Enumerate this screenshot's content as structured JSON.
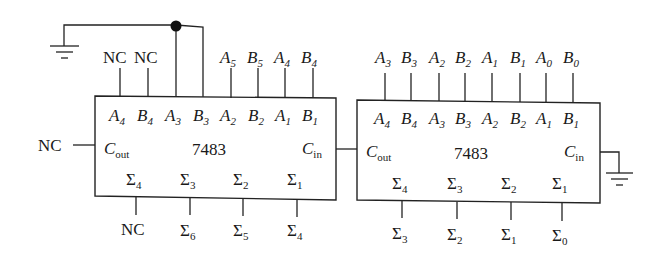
{
  "diagram": {
    "chips": [
      {
        "id": "left",
        "part": "7483",
        "inputs_inside": [
          "A4",
          "B4",
          "A3",
          "B3",
          "A2",
          "B2",
          "A1",
          "B1"
        ],
        "inputs_outside": [
          "NC",
          "NC",
          "GND",
          "GND",
          "A5",
          "B5",
          "A4",
          "B4"
        ],
        "outputs_inside": [
          "Σ4",
          "Σ3",
          "Σ2",
          "Σ1"
        ],
        "outputs_outside": [
          "NC",
          "Σ6",
          "Σ5",
          "Σ4"
        ],
        "cout": "NC",
        "cout_label": "C",
        "cout_sub": "out",
        "cin_label": "C",
        "cin_sub": "in"
      },
      {
        "id": "right",
        "part": "7483",
        "inputs_inside": [
          "A4",
          "B4",
          "A3",
          "B3",
          "A2",
          "B2",
          "A1",
          "B1"
        ],
        "inputs_outside": [
          "A3",
          "B3",
          "A2",
          "B2",
          "A1",
          "B1",
          "A0",
          "B0"
        ],
        "outputs_inside": [
          "Σ4",
          "Σ3",
          "Σ2",
          "Σ1"
        ],
        "outputs_outside": [
          "Σ3",
          "Σ2",
          "Σ1",
          "Σ0"
        ],
        "cin": "GND",
        "cout_label": "C",
        "cout_sub": "out",
        "cin_label": "C",
        "cin_sub": "in"
      }
    ],
    "nc_label": "NC",
    "connection": "Right Cout → Left Cin"
  }
}
